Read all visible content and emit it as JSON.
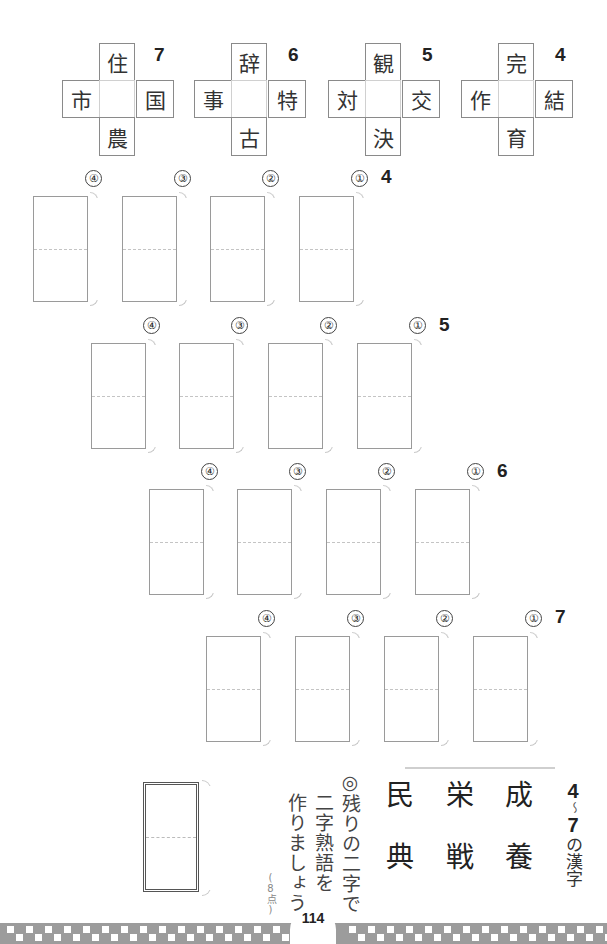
{
  "crosses": [
    {
      "number": "7",
      "top": "住",
      "left": "市",
      "right": "国",
      "bottom": "農"
    },
    {
      "number": "6",
      "top": "辞",
      "left": "事",
      "right": "特",
      "bottom": "古"
    },
    {
      "number": "5",
      "top": "観",
      "left": "対",
      "right": "交",
      "bottom": "決"
    },
    {
      "number": "4",
      "top": "完",
      "left": "作",
      "right": "結",
      "bottom": "育"
    }
  ],
  "answer_rows": [
    {
      "number": "4",
      "labels": [
        "④",
        "③",
        "②",
        "①"
      ]
    },
    {
      "number": "5",
      "labels": [
        "④",
        "③",
        "②",
        "①"
      ]
    },
    {
      "number": "6",
      "labels": [
        "④",
        "③",
        "②",
        "①"
      ]
    },
    {
      "number": "7",
      "labels": [
        "④",
        "③",
        "②",
        "①"
      ]
    }
  ],
  "bonus": {
    "title_start": "4",
    "title_tilde": "～",
    "title_end": "7",
    "title_suffix": "の漢字",
    "kanji_columns": [
      "成養",
      "栄戦",
      "民典"
    ],
    "instruction_line1": "◎残りの二字で",
    "instruction_line2": "二字熟語を",
    "instruction_line3": "作りましょう。",
    "points": "8点"
  },
  "footer": {
    "page_number": "114",
    "pattern_color": "#9c9c9c"
  }
}
